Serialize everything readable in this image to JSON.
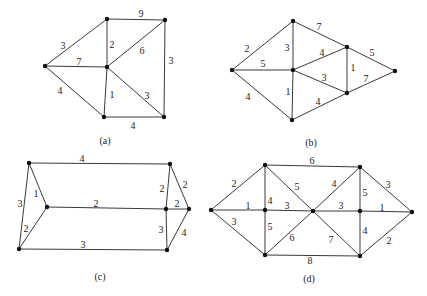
{
  "graphs": [
    {
      "id": "a",
      "caption": "(a)",
      "caption_pos": [
        105,
        140
      ],
      "nodes": [
        [
          45,
          66
        ],
        [
          107,
          19
        ],
        [
          165,
          20
        ],
        [
          107,
          67
        ],
        [
          104,
          117
        ],
        [
          164,
          117
        ]
      ],
      "edges": [
        {
          "from": 0,
          "to": 1,
          "w": "3",
          "lx": 63,
          "ly": 45
        },
        {
          "from": 0,
          "to": 3,
          "w": "7",
          "lx": 79,
          "ly": 61
        },
        {
          "from": 0,
          "to": 4,
          "w": "4",
          "lx": 60,
          "ly": 90
        },
        {
          "from": 1,
          "to": 2,
          "w": "9",
          "lx": 141,
          "ly": 13
        },
        {
          "from": 1,
          "to": 3,
          "w": "2",
          "lx": 112,
          "ly": 44
        },
        {
          "from": 3,
          "to": 2,
          "w": "6",
          "lx": 142,
          "ly": 50
        },
        {
          "from": 2,
          "to": 5,
          "w": "3",
          "lx": 171,
          "ly": 60
        },
        {
          "from": 3,
          "to": 4,
          "w": "1",
          "lx": 112,
          "ly": 94
        },
        {
          "from": 3,
          "to": 5,
          "w": "3",
          "lx": 147,
          "ly": 95
        },
        {
          "from": 4,
          "to": 5,
          "w": "4",
          "lx": 133,
          "ly": 125
        }
      ]
    },
    {
      "id": "b",
      "caption": "(b)",
      "caption_pos": [
        311,
        142
      ],
      "nodes": [
        [
          232,
          70
        ],
        [
          293,
          21
        ],
        [
          293,
          70
        ],
        [
          347,
          47
        ],
        [
          347,
          93
        ],
        [
          395,
          71
        ],
        [
          292,
          120
        ]
      ],
      "edges": [
        {
          "from": 0,
          "to": 1,
          "w": "2",
          "lx": 247,
          "ly": 48
        },
        {
          "from": 0,
          "to": 2,
          "w": "5",
          "lx": 263,
          "ly": 63
        },
        {
          "from": 0,
          "to": 6,
          "w": "4",
          "lx": 248,
          "ly": 96
        },
        {
          "from": 1,
          "to": 2,
          "w": "3",
          "lx": 287,
          "ly": 47
        },
        {
          "from": 1,
          "to": 3,
          "w": "7",
          "lx": 319,
          "ly": 26
        },
        {
          "from": 2,
          "to": 3,
          "w": "4",
          "lx": 322,
          "ly": 52
        },
        {
          "from": 2,
          "to": 4,
          "w": "3",
          "lx": 324,
          "ly": 77
        },
        {
          "from": 2,
          "to": 6,
          "w": "1",
          "lx": 288,
          "ly": 91
        },
        {
          "from": 3,
          "to": 4,
          "w": "1",
          "lx": 353,
          "ly": 67
        },
        {
          "from": 3,
          "to": 5,
          "w": "5",
          "lx": 372,
          "ly": 52
        },
        {
          "from": 4,
          "to": 5,
          "w": "7",
          "lx": 366,
          "ly": 78
        },
        {
          "from": 6,
          "to": 4,
          "w": "4",
          "lx": 318,
          "ly": 101
        }
      ]
    },
    {
      "id": "c",
      "caption": "(c)",
      "caption_pos": [
        100,
        276
      ],
      "nodes": [
        [
          29,
          163
        ],
        [
          47,
          207
        ],
        [
          19,
          249
        ],
        [
          170,
          164
        ],
        [
          166,
          209
        ],
        [
          189,
          209
        ],
        [
          167,
          250
        ]
      ],
      "edges": [
        {
          "from": 0,
          "to": 3,
          "w": "4",
          "lx": 82,
          "ly": 158
        },
        {
          "from": 0,
          "to": 1,
          "w": "1",
          "lx": 36,
          "ly": 193
        },
        {
          "from": 0,
          "to": 2,
          "w": "3",
          "lx": 20,
          "ly": 203
        },
        {
          "from": 1,
          "to": 2,
          "w": "2",
          "lx": 26,
          "ly": 228
        },
        {
          "from": 1,
          "to": 4,
          "w": "2",
          "lx": 96,
          "ly": 203
        },
        {
          "from": 2,
          "to": 6,
          "w": "3",
          "lx": 83,
          "ly": 244
        },
        {
          "from": 3,
          "to": 4,
          "w": "2",
          "lx": 162,
          "ly": 188
        },
        {
          "from": 3,
          "to": 5,
          "w": "2",
          "lx": 185,
          "ly": 184
        },
        {
          "from": 4,
          "to": 5,
          "w": "2",
          "lx": 177,
          "ly": 203
        },
        {
          "from": 4,
          "to": 6,
          "w": "3",
          "lx": 161,
          "ly": 229
        },
        {
          "from": 5,
          "to": 6,
          "w": "4",
          "lx": 184,
          "ly": 232
        }
      ]
    },
    {
      "id": "d",
      "caption": "(d)",
      "caption_pos": [
        309,
        278
      ],
      "nodes": [
        [
          211,
          210
        ],
        [
          265,
          165
        ],
        [
          265,
          210
        ],
        [
          265,
          255
        ],
        [
          313,
          211
        ],
        [
          360,
          167
        ],
        [
          360,
          211
        ],
        [
          360,
          256
        ],
        [
          412,
          212
        ]
      ],
      "edges": [
        {
          "from": 0,
          "to": 1,
          "w": "2",
          "lx": 234,
          "ly": 183
        },
        {
          "from": 0,
          "to": 2,
          "w": "1",
          "lx": 248,
          "ly": 205
        },
        {
          "from": 0,
          "to": 3,
          "w": "3",
          "lx": 234,
          "ly": 221
        },
        {
          "from": 1,
          "to": 5,
          "w": "6",
          "lx": 312,
          "ly": 160
        },
        {
          "from": 1,
          "to": 2,
          "w": "4",
          "lx": 270,
          "ly": 200
        },
        {
          "from": 1,
          "to": 4,
          "w": "5",
          "lx": 297,
          "ly": 186
        },
        {
          "from": 2,
          "to": 4,
          "w": "3",
          "lx": 287,
          "ly": 205
        },
        {
          "from": 2,
          "to": 3,
          "w": "5",
          "lx": 270,
          "ly": 226
        },
        {
          "from": 3,
          "to": 4,
          "w": "6",
          "lx": 292,
          "ly": 237
        },
        {
          "from": 3,
          "to": 7,
          "w": "8",
          "lx": 310,
          "ly": 260
        },
        {
          "from": 4,
          "to": 5,
          "w": "4",
          "lx": 334,
          "ly": 183
        },
        {
          "from": 4,
          "to": 6,
          "w": "3",
          "lx": 341,
          "ly": 205
        },
        {
          "from": 4,
          "to": 7,
          "w": "7",
          "lx": 331,
          "ly": 239
        },
        {
          "from": 5,
          "to": 6,
          "w": "5",
          "lx": 365,
          "ly": 192
        },
        {
          "from": 5,
          "to": 8,
          "w": "3",
          "lx": 388,
          "ly": 184
        },
        {
          "from": 6,
          "to": 8,
          "w": "1",
          "lx": 382,
          "ly": 207
        },
        {
          "from": 6,
          "to": 7,
          "w": "4",
          "lx": 365,
          "ly": 230
        },
        {
          "from": 7,
          "to": 8,
          "w": "2",
          "lx": 389,
          "ly": 240
        }
      ]
    }
  ]
}
